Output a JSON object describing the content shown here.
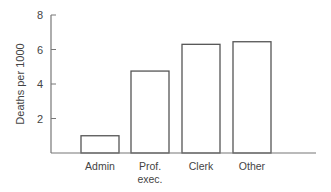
{
  "chart_data": {
    "type": "bar",
    "title": "",
    "xlabel": "",
    "ylabel": "Deaths per 1000",
    "ylim": [
      0,
      8
    ],
    "yticks": [
      2,
      4,
      6,
      8
    ],
    "categories": [
      "Admin",
      "Prof. exec.",
      "Clerk",
      "Other"
    ],
    "category_lines": [
      [
        "Admin"
      ],
      [
        "Prof.",
        "exec."
      ],
      [
        "Clerk"
      ],
      [
        "Other"
      ]
    ],
    "values": [
      1.0,
      4.75,
      6.3,
      6.45
    ],
    "grid": false,
    "legend": null,
    "bar_fill": "#ffffff",
    "bar_stroke": "#555555",
    "axis_color": "#777777"
  }
}
